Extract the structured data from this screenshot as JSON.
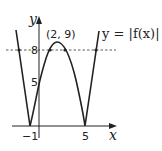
{
  "diagram": {
    "axes": {
      "x_label": "x",
      "y_label": "y"
    },
    "ticks": {
      "x_minus1": "−1",
      "x_5": "5",
      "y_5": "5",
      "y_8": "8"
    },
    "peak_label": "(2, 9)",
    "curve_label": "y = |f(x)|",
    "dashed_line_value": 8,
    "key_points": [
      {
        "x": -1,
        "y": 0
      },
      {
        "x": 5,
        "y": 0
      },
      {
        "x": 0,
        "y": 5
      },
      {
        "x": 2,
        "y": 9
      }
    ]
  }
}
